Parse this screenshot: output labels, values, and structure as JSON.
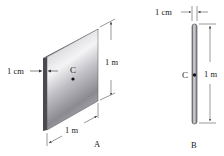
{
  "figure_a": {
    "label": "A",
    "center_label": "C",
    "thickness_label": "1 cm",
    "height_label": "1 m",
    "width_label": "1 m"
  },
  "figure_b": {
    "label": "B",
    "center_label": "C",
    "thickness_label": "1 cm",
    "height_label": "1 m"
  },
  "colors": {
    "plate_light": "#e8e8ec",
    "plate_mid": "#b4b4ba",
    "plate_dark": "#6e6e74",
    "edge": "#3c3c40",
    "line": "#333333"
  }
}
